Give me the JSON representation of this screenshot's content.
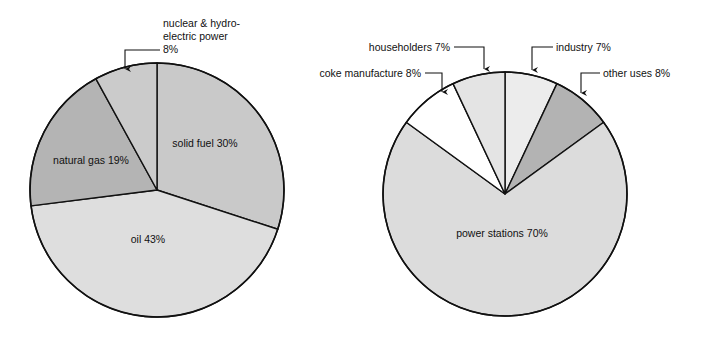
{
  "figure": {
    "background": "#ffffff",
    "line_color": "#111111"
  },
  "chart_data": [
    {
      "type": "pie",
      "id": "uk-primary-energy-sources",
      "title": "",
      "total": 100,
      "units": "percent",
      "center": [
        157,
        190
      ],
      "radius": 127,
      "start_angle_deg": 0,
      "direction": "clockwise",
      "legend": "none",
      "labels_inside": true,
      "categories": [
        "solid fuel",
        "oil",
        "natural gas",
        "nuclear & hydro-electric power"
      ],
      "values": [
        30,
        43,
        19,
        8
      ],
      "slices": [
        {
          "name": "solid fuel",
          "value": 30,
          "label": "solid fuel 30%",
          "color": "#c9c9c9",
          "label_x": 205,
          "label_y": 147,
          "label_anchor": "middle",
          "callout": false
        },
        {
          "name": "oil",
          "value": 43,
          "label": "oil 43%",
          "color": "#dedede",
          "label_x": 148,
          "label_y": 243,
          "label_anchor": "middle",
          "callout": false
        },
        {
          "name": "natural gas",
          "value": 19,
          "label": "natural gas 19%",
          "color": "#b4b4b4",
          "label_x": 91,
          "label_y": 164,
          "label_anchor": "middle",
          "callout": false
        },
        {
          "name": "nuclear & hydro-electric power",
          "value": 8,
          "label_lines": [
            "nuclear & hydro-",
            "electric power",
            "8%"
          ],
          "color": "#cbcbcb",
          "callout": true,
          "callout_x": 163,
          "callout_y": 27,
          "callout_anchor": "start",
          "leader_path": "M 160 50 L 125 50 L 125 69",
          "arrow_x": 125,
          "arrow_y": 71
        }
      ]
    },
    {
      "type": "pie",
      "id": "uk-coal-consumption-by-user",
      "title": "",
      "total": 100,
      "units": "percent",
      "center": [
        505,
        194
      ],
      "radius": 122,
      "start_angle_deg": 0,
      "direction": "clockwise",
      "legend": "none",
      "labels_inside": true,
      "categories": [
        "industry",
        "other uses",
        "power stations",
        "coke manufacture",
        "householders"
      ],
      "values": [
        7,
        8,
        70,
        8,
        7
      ],
      "slices": [
        {
          "name": "industry",
          "value": 7,
          "label": "industry 7%",
          "color": "#ececec",
          "callout": true,
          "callout_x": 556,
          "callout_y": 51,
          "callout_anchor": "start",
          "leader_path": "M 553 47 L 532 47 L 532 70",
          "arrow_x": 532,
          "arrow_y": 72
        },
        {
          "name": "other uses",
          "value": 8,
          "label": "other uses 8%",
          "color": "#b3b3b3",
          "callout": true,
          "callout_x": 603,
          "callout_y": 77,
          "callout_anchor": "start",
          "leader_path": "M 600 73 L 581 73 L 581 93",
          "arrow_x": 581,
          "arrow_y": 95
        },
        {
          "name": "power stations",
          "value": 70,
          "label": "power stations 70%",
          "color": "#dcdcdc",
          "label_x": 502,
          "label_y": 237,
          "label_anchor": "middle",
          "callout": false
        },
        {
          "name": "coke manufacture",
          "value": 8,
          "label": "coke manufacture 8%",
          "color": "#ffffff",
          "callout": true,
          "callout_x": 421,
          "callout_y": 77,
          "callout_anchor": "end",
          "leader_path": "M 425 73 L 442 73 L 442 92",
          "arrow_x": 442,
          "arrow_y": 94
        },
        {
          "name": "householders",
          "value": 7,
          "label": "householders 7%",
          "color": "#e4e4e4",
          "callout": true,
          "callout_x": 450,
          "callout_y": 51,
          "callout_anchor": "end",
          "leader_path": "M 454 47 L 484 47 L 484 69",
          "arrow_x": 484,
          "arrow_y": 71
        }
      ]
    }
  ]
}
